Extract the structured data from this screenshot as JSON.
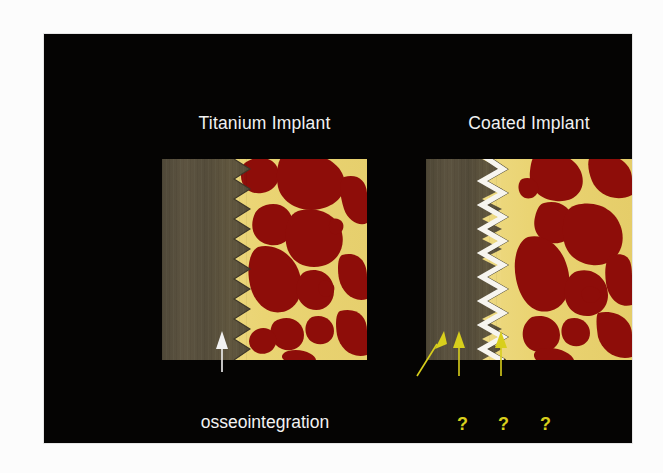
{
  "slide": {
    "background_color": "#050403",
    "panels": [
      {
        "id": "titanium",
        "title": "Titanium Implant",
        "implant_color": "#564e3c",
        "bone_color": "#ebd57a",
        "marrow_color": "#8e0d09",
        "thread_color": "#ebd57a",
        "coating": "none",
        "thread_count": 10
      },
      {
        "id": "coated",
        "title": "Coated Implant",
        "implant_color": "#564e3c",
        "bone_color": "#ebd57a",
        "marrow_color": "#8e0d09",
        "thread_color": "#ebd57a",
        "coating": "white-zigzag",
        "coating_color": "#f7f5ef",
        "thread_count": 10
      }
    ],
    "callouts": {
      "osseointegration": {
        "label": "osseointegration",
        "arrow_color": "#f2f2f2",
        "arrow_style": "vertical"
      },
      "questions": [
        {
          "label": "?",
          "arrow_color": "#d8cf1c",
          "arrow_style": "diagonal"
        },
        {
          "label": "?",
          "arrow_color": "#d8cf1c",
          "arrow_style": "vertical"
        },
        {
          "label": "?",
          "arrow_color": "#d8cf1c",
          "arrow_style": "vertical"
        }
      ]
    }
  },
  "colors": {
    "slide_background": "#050403",
    "title_text": "#f2f2f2",
    "label_text": "#f2f2f2",
    "question_yellow": "#d8cf1c",
    "implant_gray": "#564e3c",
    "bone_yellow": "#ebd57a",
    "marrow_red": "#8e0d09",
    "coating_white": "#f7f5ef",
    "page_background": "#fcfcfc"
  }
}
